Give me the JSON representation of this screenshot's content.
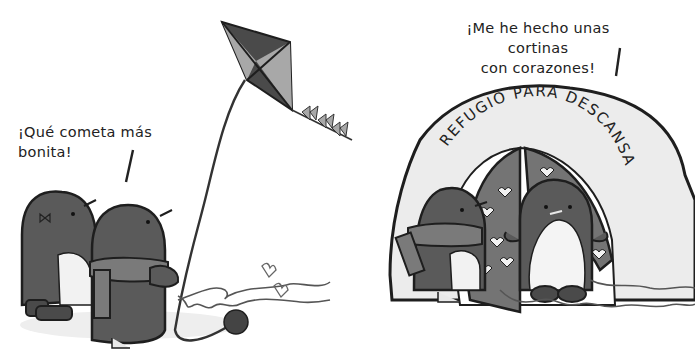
{
  "panels": [
    {
      "id": "kite-panel",
      "speech": "¡Qué cometa más bonita!",
      "scene": "Two penguins flying a dark grey diamond kite with bow-tie tail; yarn ball and looping string with hearts on the ground"
    },
    {
      "id": "shelter-panel",
      "speech_line1": "¡Me he hecho unas cortinas",
      "speech_line2": "con corazones!",
      "sign": "REFUGIO PARA DESCANSAR",
      "scene": "Snow shelter with heart-patterned curtains; a penguin with scarf and a penguin inside the doorway, looping string on the ground"
    }
  ],
  "colors": {
    "background": "#ffffff",
    "penguin_dark": "#5a5a5a",
    "penguin_belly": "#f2f2f2",
    "scarf": "#7a7a7a",
    "curtain": "#747474",
    "shelter": "#ececec",
    "outline": "#1e1e1e",
    "kite_dark": "#4a4a4a",
    "kite_light": "#a8a8a8"
  }
}
